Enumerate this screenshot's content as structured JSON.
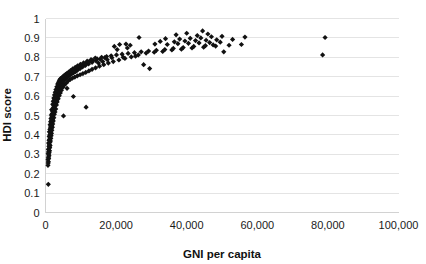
{
  "chart_data": {
    "type": "scatter",
    "title": "",
    "xlabel": "GNI per capita",
    "ylabel": "HDI score",
    "xlim": [
      0,
      100000
    ],
    "ylim": [
      0,
      1
    ],
    "grid": true,
    "legend": false,
    "marker": "diamond",
    "marker_color": "#111111",
    "xticks": [
      0,
      20000,
      40000,
      60000,
      80000,
      100000
    ],
    "xticklabels": [
      "0",
      "20,000",
      "40,000",
      "60,000",
      "80,000",
      "100,000"
    ],
    "yticks": [
      0,
      0.1,
      0.2,
      0.3,
      0.4,
      0.5,
      0.6,
      0.7,
      0.8,
      0.9,
      1
    ],
    "yticklabels": [
      "0",
      "0.1",
      "0.2",
      "0.3",
      "0.4",
      "0.5",
      "0.6",
      "0.7",
      "0.8",
      "0.9",
      "1"
    ],
    "points": [
      [
        800,
        0.145
      ],
      [
        700,
        0.243
      ],
      [
        760,
        0.255
      ],
      [
        820,
        0.262
      ],
      [
        700,
        0.272
      ],
      [
        900,
        0.278
      ],
      [
        800,
        0.285
      ],
      [
        1000,
        0.292
      ],
      [
        880,
        0.298
      ],
      [
        760,
        0.305
      ],
      [
        1050,
        0.308
      ],
      [
        900,
        0.315
      ],
      [
        1150,
        0.318
      ],
      [
        820,
        0.325
      ],
      [
        1000,
        0.33
      ],
      [
        1200,
        0.335
      ],
      [
        950,
        0.342
      ],
      [
        1300,
        0.345
      ],
      [
        1100,
        0.352
      ],
      [
        880,
        0.358
      ],
      [
        1250,
        0.362
      ],
      [
        1400,
        0.368
      ],
      [
        1000,
        0.372
      ],
      [
        1150,
        0.378
      ],
      [
        1500,
        0.382
      ],
      [
        1300,
        0.388
      ],
      [
        1050,
        0.392
      ],
      [
        1600,
        0.396
      ],
      [
        1200,
        0.4
      ],
      [
        1450,
        0.404
      ],
      [
        1700,
        0.408
      ],
      [
        1350,
        0.412
      ],
      [
        1100,
        0.416
      ],
      [
        1550,
        0.42
      ],
      [
        1800,
        0.424
      ],
      [
        1250,
        0.428
      ],
      [
        1650,
        0.432
      ],
      [
        1400,
        0.436
      ],
      [
        1950,
        0.44
      ],
      [
        1500,
        0.444
      ],
      [
        1750,
        0.448
      ],
      [
        1300,
        0.452
      ],
      [
        2050,
        0.456
      ],
      [
        1600,
        0.46
      ],
      [
        1850,
        0.464
      ],
      [
        1450,
        0.468
      ],
      [
        2200,
        0.472
      ],
      [
        1700,
        0.476
      ],
      [
        1950,
        0.48
      ],
      [
        1550,
        0.484
      ],
      [
        2350,
        0.488
      ],
      [
        1800,
        0.492
      ],
      [
        2100,
        0.496
      ],
      [
        5100,
        0.498
      ],
      [
        1650,
        0.502
      ],
      [
        2500,
        0.506
      ],
      [
        1900,
        0.51
      ],
      [
        2250,
        0.514
      ],
      [
        2700,
        0.518
      ],
      [
        2000,
        0.522
      ],
      [
        2400,
        0.526
      ],
      [
        1750,
        0.53
      ],
      [
        2900,
        0.534
      ],
      [
        2150,
        0.538
      ],
      [
        11500,
        0.543
      ],
      [
        2600,
        0.546
      ],
      [
        2300,
        0.55
      ],
      [
        3100,
        0.554
      ],
      [
        2050,
        0.558
      ],
      [
        2800,
        0.562
      ],
      [
        2450,
        0.566
      ],
      [
        3300,
        0.57
      ],
      [
        2200,
        0.574
      ],
      [
        3000,
        0.578
      ],
      [
        2650,
        0.582
      ],
      [
        3600,
        0.586
      ],
      [
        2350,
        0.59
      ],
      [
        3250,
        0.594
      ],
      [
        2850,
        0.598
      ],
      [
        7900,
        0.598
      ],
      [
        3900,
        0.602
      ],
      [
        2550,
        0.606
      ],
      [
        3500,
        0.61
      ],
      [
        3050,
        0.614
      ],
      [
        4200,
        0.616
      ],
      [
        2750,
        0.62
      ],
      [
        3750,
        0.624
      ],
      [
        3300,
        0.628
      ],
      [
        4500,
        0.63
      ],
      [
        2950,
        0.634
      ],
      [
        4000,
        0.638
      ],
      [
        3550,
        0.642
      ],
      [
        6100,
        0.64
      ],
      [
        4900,
        0.645
      ],
      [
        3200,
        0.648
      ],
      [
        4300,
        0.652
      ],
      [
        3800,
        0.656
      ],
      [
        5400,
        0.658
      ],
      [
        3450,
        0.662
      ],
      [
        4650,
        0.664
      ],
      [
        4100,
        0.668
      ],
      [
        5900,
        0.668
      ],
      [
        3700,
        0.672
      ],
      [
        5000,
        0.674
      ],
      [
        4400,
        0.678
      ],
      [
        6400,
        0.678
      ],
      [
        3950,
        0.682
      ],
      [
        5350,
        0.684
      ],
      [
        4750,
        0.686
      ],
      [
        7000,
        0.686
      ],
      [
        4250,
        0.69
      ],
      [
        5700,
        0.69
      ],
      [
        5050,
        0.692
      ],
      [
        7600,
        0.692
      ],
      [
        4600,
        0.694
      ],
      [
        6100,
        0.696
      ],
      [
        5400,
        0.698
      ],
      [
        8300,
        0.698
      ],
      [
        4950,
        0.7
      ],
      [
        6500,
        0.702
      ],
      [
        5800,
        0.704
      ],
      [
        9000,
        0.704
      ],
      [
        5300,
        0.706
      ],
      [
        6900,
        0.708
      ],
      [
        6200,
        0.71
      ],
      [
        9800,
        0.71
      ],
      [
        5700,
        0.712
      ],
      [
        7400,
        0.714
      ],
      [
        6700,
        0.716
      ],
      [
        10600,
        0.716
      ],
      [
        6150,
        0.718
      ],
      [
        7900,
        0.72
      ],
      [
        7200,
        0.722
      ],
      [
        11400,
        0.722
      ],
      [
        6600,
        0.724
      ],
      [
        8500,
        0.726
      ],
      [
        7700,
        0.728
      ],
      [
        12300,
        0.73
      ],
      [
        7100,
        0.732
      ],
      [
        9100,
        0.734
      ],
      [
        8300,
        0.736
      ],
      [
        13200,
        0.738
      ],
      [
        7700,
        0.74
      ],
      [
        9800,
        0.742
      ],
      [
        8900,
        0.744
      ],
      [
        14200,
        0.746
      ],
      [
        8400,
        0.748
      ],
      [
        10500,
        0.75
      ],
      [
        9600,
        0.752
      ],
      [
        15300,
        0.754
      ],
      [
        9100,
        0.756
      ],
      [
        11300,
        0.758
      ],
      [
        10400,
        0.76
      ],
      [
        16500,
        0.762
      ],
      [
        9900,
        0.764
      ],
      [
        12200,
        0.766
      ],
      [
        11300,
        0.768
      ],
      [
        17800,
        0.77
      ],
      [
        10800,
        0.772
      ],
      [
        13200,
        0.774
      ],
      [
        12300,
        0.776
      ],
      [
        19200,
        0.778
      ],
      [
        11800,
        0.78
      ],
      [
        14300,
        0.782
      ],
      [
        13400,
        0.784
      ],
      [
        20800,
        0.786
      ],
      [
        12900,
        0.788
      ],
      [
        15500,
        0.79
      ],
      [
        14600,
        0.792
      ],
      [
        22500,
        0.794
      ],
      [
        14100,
        0.796
      ],
      [
        16800,
        0.798
      ],
      [
        15900,
        0.8
      ],
      [
        24300,
        0.802
      ],
      [
        29500,
        0.742
      ],
      [
        27800,
        0.762
      ],
      [
        17300,
        0.804
      ],
      [
        18600,
        0.808
      ],
      [
        20100,
        0.812
      ],
      [
        26300,
        0.812
      ],
      [
        21700,
        0.816
      ],
      [
        23400,
        0.82
      ],
      [
        28500,
        0.822
      ],
      [
        25200,
        0.824
      ],
      [
        30800,
        0.826
      ],
      [
        27100,
        0.828
      ],
      [
        33200,
        0.83
      ],
      [
        29200,
        0.832
      ],
      [
        50500,
        0.828
      ],
      [
        31400,
        0.836
      ],
      [
        35800,
        0.838
      ],
      [
        33800,
        0.84
      ],
      [
        38500,
        0.842
      ],
      [
        36200,
        0.846
      ],
      [
        41500,
        0.848
      ],
      [
        39000,
        0.85
      ],
      [
        44800,
        0.852
      ],
      [
        42000,
        0.856
      ],
      [
        48200,
        0.858
      ],
      [
        45300,
        0.86
      ],
      [
        52000,
        0.862
      ],
      [
        47500,
        0.864
      ],
      [
        55500,
        0.866
      ],
      [
        34500,
        0.866
      ],
      [
        31000,
        0.868
      ],
      [
        37500,
        0.87
      ],
      [
        40500,
        0.872
      ],
      [
        43500,
        0.874
      ],
      [
        46500,
        0.876
      ],
      [
        49500,
        0.878
      ],
      [
        36500,
        0.88
      ],
      [
        32500,
        0.882
      ],
      [
        39500,
        0.884
      ],
      [
        42500,
        0.886
      ],
      [
        45500,
        0.888
      ],
      [
        48500,
        0.89
      ],
      [
        53000,
        0.892
      ],
      [
        38000,
        0.894
      ],
      [
        34000,
        0.896
      ],
      [
        41000,
        0.898
      ],
      [
        44000,
        0.9
      ],
      [
        26500,
        0.902
      ],
      [
        56500,
        0.904
      ],
      [
        47000,
        0.906
      ],
      [
        50000,
        0.908
      ],
      [
        43000,
        0.912
      ],
      [
        37000,
        0.916
      ],
      [
        46000,
        0.92
      ],
      [
        40000,
        0.924
      ],
      [
        44500,
        0.936
      ],
      [
        78500,
        0.812
      ],
      [
        79200,
        0.902
      ],
      [
        21000,
        0.866
      ],
      [
        22800,
        0.868
      ],
      [
        24000,
        0.862
      ],
      [
        19500,
        0.856
      ],
      [
        23200,
        0.848
      ],
      [
        20300,
        0.84
      ],
      [
        25500,
        0.806
      ],
      [
        22000,
        0.8
      ],
      [
        18800,
        0.798
      ],
      [
        17500,
        0.788
      ],
      [
        16200,
        0.778
      ],
      [
        15000,
        0.77
      ]
    ]
  }
}
